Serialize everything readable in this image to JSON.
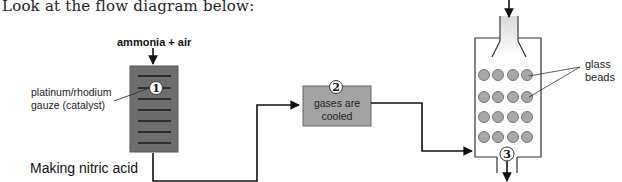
{
  "intro_text": "Look at the flow diagram below:",
  "feed": {
    "label": "ammonia + air"
  },
  "catalyst": {
    "label_line1": "platinum/rhodium",
    "label_line2": "gauze (catalyst)",
    "step": "1",
    "fill": "#6e6e6e"
  },
  "cooler": {
    "line1": "gases are",
    "line2": "cooled",
    "step": "2",
    "fill": "#a3a3a3"
  },
  "absorber": {
    "step": "3",
    "bead_fill": "#a8a8a8",
    "bead_rows": 4,
    "bead_cols": 4,
    "beads_label_line1": "glass",
    "beads_label_line2": "beads"
  },
  "caption": "Making nitric acid"
}
